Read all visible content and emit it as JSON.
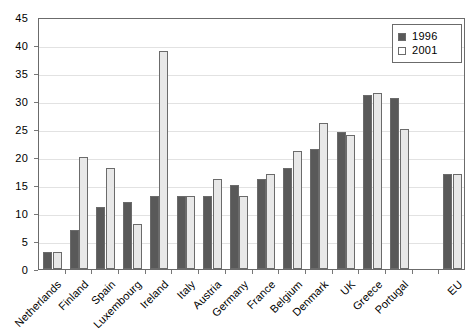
{
  "chart_data": {
    "type": "bar",
    "title": "",
    "subtitle": "",
    "xlabel": "",
    "ylabel": "",
    "ylim": [
      0,
      45
    ],
    "ytick_step": 5,
    "yticks": [
      0,
      5,
      10,
      15,
      20,
      25,
      30,
      35,
      40,
      45
    ],
    "grid": true,
    "legend_position": "top-right",
    "categories": [
      "Netherlands",
      "Finland",
      "Spain",
      "Luxembourg",
      "Ireland",
      "Italy",
      "Austria",
      "Germany",
      "France",
      "Belgium",
      "Denmark",
      "UK",
      "Greece",
      "Portugal",
      "",
      "EU"
    ],
    "series": [
      {
        "name": "1996",
        "color": "#595959",
        "values": [
          3,
          7,
          11,
          12,
          13,
          13,
          13,
          15,
          16,
          18,
          21.5,
          24.5,
          31,
          30.5,
          null,
          17
        ]
      },
      {
        "name": "2001",
        "color": "#e8e8e8",
        "values": [
          3,
          20,
          18,
          8,
          39,
          13,
          16,
          13,
          17,
          21,
          26,
          24,
          31.5,
          25,
          null,
          17
        ]
      }
    ]
  },
  "legend": {
    "entries": [
      {
        "label": "1996",
        "swatch": "legend-swatch-dark"
      },
      {
        "label": "2001",
        "swatch": "legend-swatch-light"
      }
    ]
  },
  "colors": {
    "series_1996": "#595959",
    "series_2001": "#e8e8e8",
    "axis": "#6b6b6b",
    "gridline": "#e2e2e2",
    "background": "#ffffff",
    "text": "#000000"
  }
}
